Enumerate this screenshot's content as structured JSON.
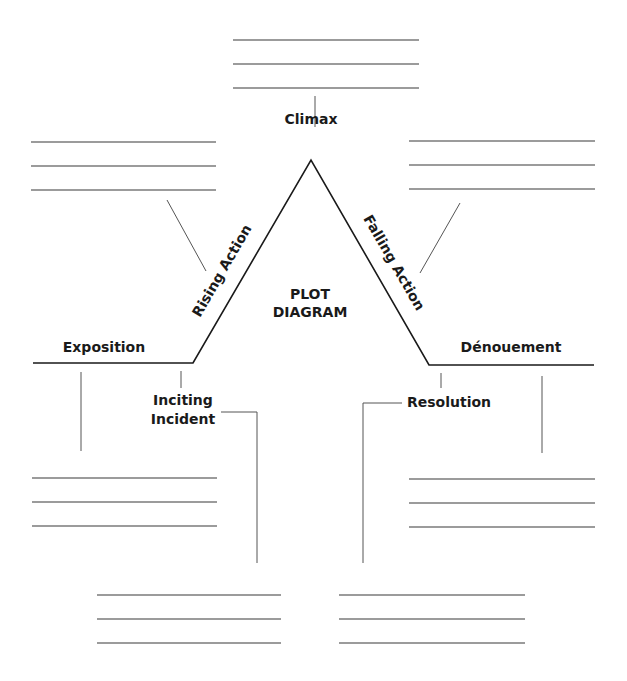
{
  "title": {
    "line1": "PLOT",
    "line2": "DIAGRAM"
  },
  "stages": {
    "exposition": "Exposition",
    "inciting_incident_line1": "Inciting",
    "inciting_incident_line2": "Incident",
    "rising_action": "Rising Action",
    "climax": "Climax",
    "falling_action": "Falling Action",
    "resolution": "Resolution",
    "denouement": "Dénouement"
  },
  "answer_boxes": [
    {
      "stage": "climax",
      "lines": 3
    },
    {
      "stage": "rising_action",
      "lines": 3
    },
    {
      "stage": "falling_action",
      "lines": 3
    },
    {
      "stage": "exposition",
      "lines": 3
    },
    {
      "stage": "denouement",
      "lines": 3
    },
    {
      "stage": "inciting_incident",
      "lines": 3
    },
    {
      "stage": "resolution",
      "lines": 3
    }
  ],
  "colors": {
    "plot_line": "#1a1a1a",
    "write_line": "#7a7a7a",
    "connector": "#555555",
    "background": "#ffffff"
  }
}
